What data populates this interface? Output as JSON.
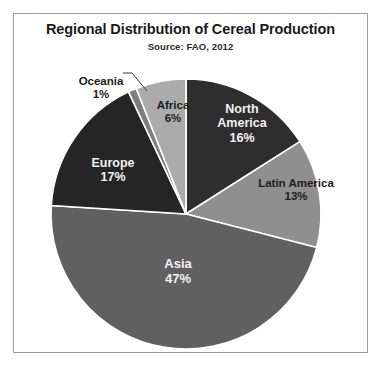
{
  "chart": {
    "title": "Regional Distribution of Cereal Production",
    "source": "Source:  FAO, 2012"
  },
  "chart_data": {
    "type": "pie",
    "title": "Regional Distribution of Cereal Production",
    "subtitle": "Source:  FAO, 2012",
    "unit": "%",
    "start_angle_deg": 0,
    "direction": "clockwise",
    "legend": "none",
    "labels_position": "inside-slices-with-callout-for-oceania",
    "categories": [
      "North America",
      "Latin America",
      "Asia",
      "Europe",
      "Oceania",
      "Africa"
    ],
    "values": [
      16,
      13,
      47,
      17,
      1,
      6
    ],
    "slices": [
      {
        "name": "North America",
        "label": "North America",
        "value": 16,
        "value_text": "16%",
        "color": "#2e2e2e",
        "text_color": "#f2f2f2",
        "start_deg": 0,
        "end_deg": 57.6
      },
      {
        "name": "Latin America",
        "label": "Latin America",
        "value": 13,
        "value_text": "13%",
        "color": "#8f8f8f",
        "text_color": "#1e1e1e",
        "start_deg": 57.6,
        "end_deg": 104.4
      },
      {
        "name": "Asia",
        "label": "Asia",
        "value": 47,
        "value_text": "47%",
        "color": "#606060",
        "text_color": "#f2f2f2",
        "start_deg": 104.4,
        "end_deg": 273.6
      },
      {
        "name": "Europe",
        "label": "Europe",
        "value": 17,
        "value_text": "17%",
        "color": "#252525",
        "text_color": "#f2f2f2",
        "start_deg": 273.6,
        "end_deg": 334.8
      },
      {
        "name": "Oceania",
        "label": "Oceania",
        "value": 1,
        "value_text": "1%",
        "color": "#7e7e7e",
        "text_color": "#1e1e1e",
        "start_deg": 334.8,
        "end_deg": 338.4
      },
      {
        "name": "Africa",
        "label": "Africa",
        "value": 6,
        "value_text": "6%",
        "color": "#ababab",
        "text_color": "#1e1e1e",
        "start_deg": 338.4,
        "end_deg": 360
      }
    ]
  }
}
